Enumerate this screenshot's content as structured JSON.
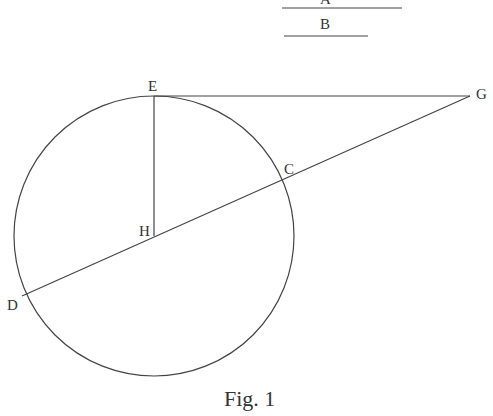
{
  "segments": {
    "A": {
      "label": "A",
      "x1": 282,
      "x2": 402,
      "y": 8
    },
    "B": {
      "label": "B",
      "x1": 284,
      "x2": 368,
      "y": 36
    }
  },
  "circle": {
    "cx": 154,
    "cy": 236,
    "r": 140
  },
  "points": {
    "E": {
      "label": "E",
      "x": 154,
      "y": 96
    },
    "G": {
      "label": "G",
      "x": 470,
      "y": 96
    },
    "C": {
      "label": "C",
      "x": 283,
      "y": 179
    },
    "H": {
      "label": "H",
      "x": 154,
      "y": 236
    },
    "D": {
      "label": "D",
      "x": 22,
      "y": 296
    }
  },
  "caption": "Fig. 1",
  "colors": {
    "stroke": "#444444",
    "text": "#333333"
  }
}
